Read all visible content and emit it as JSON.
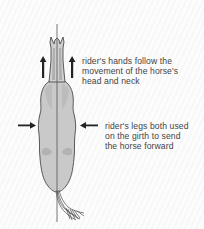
{
  "diagram": {
    "annotations": [
      {
        "id": "hands",
        "lines": [
          "rider's hands follow the",
          "movement of the horse's",
          "head and neck"
        ],
        "arrow_direction": "up"
      },
      {
        "id": "legs",
        "lines": [
          "rider's legs both used",
          "on the girth to send",
          "the horse forward"
        ],
        "arrow_direction": "inward"
      }
    ],
    "colors": {
      "background": "#fbfbfb",
      "horse_fill": "#c8c8c8",
      "horse_outline": "#4a4a4a",
      "center_line": "#555555",
      "arrows": "#222222",
      "text": "#444444"
    }
  }
}
